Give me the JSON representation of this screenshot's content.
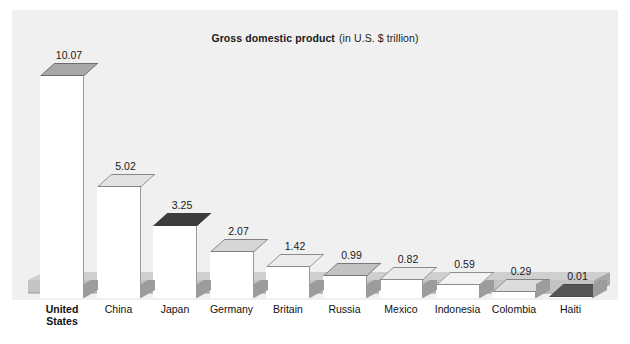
{
  "chart_data": {
    "type": "bar",
    "title_bold_part": "Gross domestic product",
    "title_regular_part": "(in U.S. $ trillion)",
    "xlabel": "",
    "ylabel": "",
    "ylim": [
      0,
      10.07
    ],
    "grid": false,
    "legend": "none",
    "units": "U.S. $ trillion",
    "categories": [
      "United States",
      "China",
      "Japan",
      "Germany",
      "Britain",
      "Russia",
      "Mexico",
      "Indonesia",
      "Colombia",
      "Haiti"
    ],
    "values": [
      10.07,
      5.02,
      3.25,
      2.07,
      1.42,
      0.99,
      0.82,
      0.59,
      0.29,
      0.01
    ],
    "value_labels": [
      "10.07",
      "5.02",
      "3.25",
      "2.07",
      "1.42",
      "0.99",
      "0.82",
      "0.59",
      "0.29",
      "0.01"
    ],
    "bars": [
      {
        "category": "United States",
        "category_display": "United\nStates",
        "value": 10.07,
        "value_label": "10.07",
        "top_color": "#a8a8a8",
        "emphasis": true
      },
      {
        "category": "China",
        "category_display": "China",
        "value": 5.02,
        "value_label": "5.02",
        "top_color": "#e2e2e2",
        "emphasis": false
      },
      {
        "category": "Japan",
        "category_display": "Japan",
        "value": 3.25,
        "value_label": "3.25",
        "top_color": "#3c3c3c",
        "emphasis": false
      },
      {
        "category": "Germany",
        "category_display": "Germany",
        "value": 2.07,
        "value_label": "2.07",
        "top_color": "#d6d6d6",
        "emphasis": false
      },
      {
        "category": "Britain",
        "category_display": "Britain",
        "value": 1.42,
        "value_label": "1.42",
        "top_color": "#ececec",
        "emphasis": false
      },
      {
        "category": "Russia",
        "category_display": "Russia",
        "value": 0.99,
        "value_label": "0.99",
        "top_color": "#c2c2c2",
        "emphasis": false
      },
      {
        "category": "Mexico",
        "category_display": "Mexico",
        "value": 0.82,
        "value_label": "0.82",
        "top_color": "#eaeaea",
        "emphasis": false
      },
      {
        "category": "Indonesia",
        "category_display": "Indonesia",
        "value": 0.59,
        "value_label": "0.59",
        "top_color": "#f2f2f2",
        "emphasis": false
      },
      {
        "category": "Colombia",
        "category_display": "Colombia",
        "value": 0.29,
        "value_label": "0.29",
        "top_color": "#dcdcdc",
        "emphasis": false
      },
      {
        "category": "Haiti",
        "category_display": "Haiti",
        "value": 0.01,
        "value_label": "0.01",
        "top_color": "#555555",
        "emphasis": false
      }
    ],
    "colors": {
      "background": "#f0f0f0",
      "page": "#ffffff",
      "floor": "#bdbdbd",
      "floor_shadow": "#9e9e9e",
      "bar_front": "#ffffff",
      "text": "#111111"
    }
  }
}
